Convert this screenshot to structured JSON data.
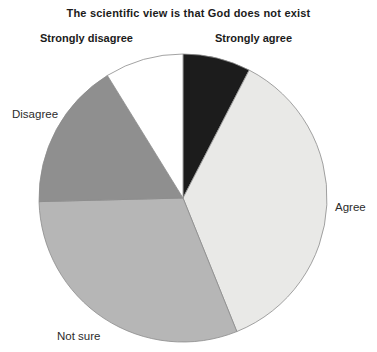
{
  "chart_data": {
    "type": "pie",
    "title": "The scientific view is that God does not exist",
    "slices": [
      {
        "label": "Strongly agree",
        "value": 7.6,
        "color": "#1c1c1c"
      },
      {
        "label": "Agree",
        "value": 36.3,
        "color": "#e9e9e7"
      },
      {
        "label": "Not sure",
        "value": 30.7,
        "color": "#b6b6b6"
      },
      {
        "label": "Disagree",
        "value": 16.6,
        "color": "#8f8f8f"
      },
      {
        "label": "Strongly disagree",
        "value": 8.8,
        "color": "#ffffff"
      }
    ],
    "units": "percent",
    "start_angle_deg": 0,
    "direction": "clockwise",
    "outline_color": "#8c8c8c",
    "legend_position": "none",
    "label_style": "annotations-around-pie"
  }
}
